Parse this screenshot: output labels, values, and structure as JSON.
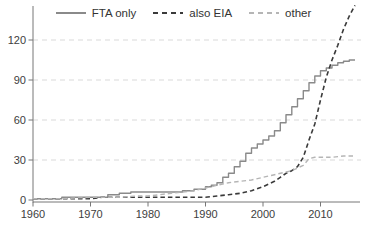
{
  "chart_data": {
    "type": "line",
    "title": "",
    "xlabel": "",
    "ylabel": "",
    "xlim": [
      1960,
      2016.5
    ],
    "ylim": [
      0,
      150
    ],
    "x_ticks": [
      1960,
      1970,
      1980,
      1990,
      2000,
      2010
    ],
    "y_ticks": [
      0,
      30,
      60,
      90,
      120
    ],
    "grid": "horizontal-dashed",
    "legend_position": "top-center",
    "series": [
      {
        "name": "FTA only",
        "style": "solid",
        "color": "#8a8a8a",
        "width": 1.4,
        "interpolation": "step-after",
        "points": [
          [
            1960,
            1
          ],
          [
            1964,
            1
          ],
          [
            1965,
            2
          ],
          [
            1970,
            2
          ],
          [
            1971,
            2
          ],
          [
            1973,
            4
          ],
          [
            1975,
            5
          ],
          [
            1977,
            6
          ],
          [
            1983,
            6
          ],
          [
            1986,
            7
          ],
          [
            1988,
            8
          ],
          [
            1990,
            10
          ],
          [
            1991,
            11
          ],
          [
            1992,
            13
          ],
          [
            1993,
            17
          ],
          [
            1994,
            20
          ],
          [
            1995,
            25
          ],
          [
            1996,
            29
          ],
          [
            1997,
            35
          ],
          [
            1998,
            39
          ],
          [
            1999,
            42
          ],
          [
            2000,
            45
          ],
          [
            2001,
            48
          ],
          [
            2002,
            52
          ],
          [
            2003,
            58
          ],
          [
            2004,
            64
          ],
          [
            2005,
            70
          ],
          [
            2006,
            76
          ],
          [
            2007,
            82
          ],
          [
            2008,
            88
          ],
          [
            2009,
            93
          ],
          [
            2010,
            97
          ],
          [
            2011,
            99
          ],
          [
            2012,
            101
          ],
          [
            2013,
            103
          ],
          [
            2014,
            104
          ],
          [
            2015,
            105
          ],
          [
            2016,
            105
          ]
        ]
      },
      {
        "name": "also EIA",
        "style": "dashed",
        "color": "#3a3a3a",
        "width": 1.6,
        "interpolation": "linear",
        "points": [
          [
            1960,
            1
          ],
          [
            1970,
            1
          ],
          [
            1972,
            2
          ],
          [
            1980,
            2
          ],
          [
            1990,
            2
          ],
          [
            1992,
            3
          ],
          [
            1994,
            4
          ],
          [
            1996,
            5
          ],
          [
            1998,
            7
          ],
          [
            2000,
            10
          ],
          [
            2001,
            12
          ],
          [
            2002,
            14
          ],
          [
            2003,
            17
          ],
          [
            2004,
            20
          ],
          [
            2005,
            22
          ],
          [
            2006,
            25
          ],
          [
            2007,
            32
          ],
          [
            2008,
            45
          ],
          [
            2009,
            57
          ],
          [
            2010,
            75
          ],
          [
            2011,
            92
          ],
          [
            2012,
            105
          ],
          [
            2013,
            116
          ],
          [
            2014,
            128
          ],
          [
            2015,
            138
          ],
          [
            2016,
            146
          ]
        ]
      },
      {
        "name": "other",
        "style": "dashed",
        "color": "#b5b5b5",
        "width": 1.4,
        "interpolation": "linear",
        "points": [
          [
            1960,
            1
          ],
          [
            1965,
            1
          ],
          [
            1970,
            2
          ],
          [
            1975,
            2
          ],
          [
            1978,
            3
          ],
          [
            1980,
            3
          ],
          [
            1982,
            4
          ],
          [
            1984,
            5
          ],
          [
            1986,
            6
          ],
          [
            1988,
            7
          ],
          [
            1990,
            9
          ],
          [
            1992,
            11
          ],
          [
            1994,
            13
          ],
          [
            1996,
            14
          ],
          [
            1998,
            15
          ],
          [
            2000,
            17
          ],
          [
            2002,
            19
          ],
          [
            2004,
            21
          ],
          [
            2005,
            22
          ],
          [
            2006,
            24
          ],
          [
            2007,
            26
          ],
          [
            2008,
            31
          ],
          [
            2009,
            32
          ],
          [
            2012,
            32
          ],
          [
            2014,
            33
          ],
          [
            2016,
            33
          ]
        ]
      }
    ],
    "colors": {
      "gridline": "#d9d9d9",
      "axis": "#777777",
      "tick_label": "#3d3d3d",
      "background": "#ffffff"
    }
  }
}
